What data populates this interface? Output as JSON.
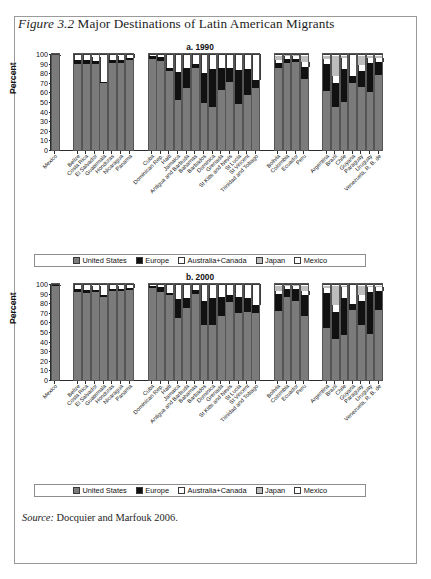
{
  "figure": {
    "label": "Figure 3.2",
    "title": "Major Destinations of Latin American Migrants",
    "source_label": "Source:",
    "source_text": "Docquier and Marfouk 2006."
  },
  "legend": {
    "items": [
      {
        "label": "United States",
        "color": "#7b7b7b",
        "key": "us"
      },
      {
        "label": "Europe",
        "color": "#111111",
        "key": "eu"
      },
      {
        "label": "Australia+Canada",
        "color": "#ffffff",
        "key": "ac"
      },
      {
        "label": "Japan",
        "color": "#bdbdbd",
        "key": "jp"
      },
      {
        "label": "Mexico",
        "color": "#ffffff",
        "key": "mx"
      }
    ]
  },
  "axis": {
    "ylabel": "Percent",
    "yticks": [
      0,
      10,
      20,
      30,
      40,
      50,
      60,
      70,
      80,
      90,
      100
    ],
    "ylim": [
      0,
      100
    ]
  },
  "chart_data": [
    {
      "type": "bar",
      "title": "a. 1990",
      "stacked": true,
      "xlabel": "",
      "ylabel": "Percent",
      "ylim": [
        0,
        100
      ],
      "grid": false,
      "legend_position": "bottom",
      "series": [
        {
          "name": "United States",
          "key": "us"
        },
        {
          "name": "Europe",
          "key": "eu"
        },
        {
          "name": "Australia+Canada",
          "key": "ac"
        },
        {
          "name": "Japan",
          "key": "jp"
        },
        {
          "name": "Mexico",
          "key": "mx"
        }
      ],
      "groups": [
        {
          "name": "Mexico",
          "categories": [
            "Mexico"
          ],
          "values": [
            [
              99.5,
              0.3,
              0.1,
              0.1,
              0.0
            ]
          ]
        },
        {
          "name": "Central America",
          "categories": [
            "Belize",
            "Costa Rica",
            "El Salvador",
            "Guatemala",
            "Honduras",
            "Nicaragua",
            "Panama"
          ],
          "values": [
            [
              91,
              4,
              5,
              0,
              0
            ],
            [
              91,
              4,
              5,
              0,
              0
            ],
            [
              91,
              3,
              4,
              0,
              2
            ],
            [
              70,
              2,
              26,
              0,
              2
            ],
            [
              92,
              3,
              5,
              0,
              0
            ],
            [
              92,
              3,
              4,
              0,
              1
            ],
            [
              95,
              2,
              3,
              0,
              0
            ]
          ]
        },
        {
          "name": "Caribbean",
          "categories": [
            "Cuba",
            "Dominican Rep.",
            "Haiti",
            "Jamaica",
            "Antigua and Barbuda",
            "Bahamas",
            "Barbados",
            "Dominica",
            "Grenada",
            "St Kitts and Nevis",
            "St Lucia",
            "St Vincent",
            "Trinidad and Tobago"
          ],
          "values": [
            [
              96,
              3,
              1,
              0,
              0
            ],
            [
              94,
              4,
              2,
              0,
              0
            ],
            [
              83,
              3,
              14,
              0,
              0
            ],
            [
              53,
              29,
              18,
              0,
              0
            ],
            [
              65,
              21,
              14,
              0,
              0
            ],
            [
              86,
              5,
              9,
              0,
              0
            ],
            [
              50,
              31,
              19,
              0,
              0
            ],
            [
              45,
              40,
              15,
              0,
              0
            ],
            [
              63,
              23,
              14,
              0,
              0
            ],
            [
              72,
              14,
              14,
              0,
              0
            ],
            [
              48,
              36,
              16,
              0,
              0
            ],
            [
              58,
              27,
              15,
              0,
              0
            ],
            [
              65,
              9,
              26,
              0,
              0
            ]
          ]
        },
        {
          "name": "Andean",
          "categories": [
            "Bolivia",
            "Colombia",
            "Ecuador",
            "Peru"
          ],
          "values": [
            [
              86,
              6,
              3,
              4,
              1
            ],
            [
              92,
              4,
              3,
              1,
              0
            ],
            [
              93,
              3,
              3,
              1,
              0
            ],
            [
              75,
              12,
              6,
              6,
              1
            ]
          ]
        },
        {
          "name": "Southern Cone and other",
          "categories": [
            "Argentina",
            "Brazil",
            "Chile",
            "Guyana",
            "Paraguay",
            "Uruguay",
            "Venezuela, R. B. de"
          ],
          "values": [
            [
              62,
              29,
              5,
              3,
              1
            ],
            [
              45,
              26,
              7,
              21,
              1
            ],
            [
              50,
              35,
              12,
              2,
              1
            ],
            [
              71,
              7,
              22,
              0,
              0
            ],
            [
              66,
              17,
              6,
              10,
              1
            ],
            [
              61,
              31,
              5,
              2,
              1
            ],
            [
              79,
              14,
              4,
              2,
              1
            ]
          ]
        }
      ]
    },
    {
      "type": "bar",
      "title": "b. 2000",
      "stacked": true,
      "xlabel": "",
      "ylabel": "Percent",
      "ylim": [
        0,
        100
      ],
      "grid": false,
      "legend_position": "bottom",
      "series": [
        {
          "name": "United States",
          "key": "us"
        },
        {
          "name": "Europe",
          "key": "eu"
        },
        {
          "name": "Australia+Canada",
          "key": "ac"
        },
        {
          "name": "Japan",
          "key": "jp"
        },
        {
          "name": "Mexico",
          "key": "mx"
        }
      ],
      "groups": [
        {
          "name": "Mexico",
          "categories": [
            "Mexico"
          ],
          "values": [
            [
              99.3,
              0.4,
              0.2,
              0.1,
              0.0
            ]
          ]
        },
        {
          "name": "Central America",
          "categories": [
            "Belize",
            "Costa Rica",
            "El Salvador",
            "Guatemala",
            "Honduras",
            "Nicaragua",
            "Panama"
          ],
          "values": [
            [
              93,
              3,
              4,
              0,
              0
            ],
            [
              92,
              3,
              5,
              0,
              0
            ],
            [
              93,
              2,
              4,
              0,
              1
            ],
            [
              87,
              2,
              10,
              0,
              1
            ],
            [
              94,
              2,
              4,
              0,
              0
            ],
            [
              94,
              2,
              3,
              0,
              1
            ],
            [
              95,
              2,
              3,
              0,
              0
            ]
          ]
        },
        {
          "name": "Caribbean",
          "categories": [
            "Cuba",
            "Dominican Rep.",
            "Haiti",
            "Jamaica",
            "Antigua and Barbuda",
            "Bahamas",
            "Barbados",
            "Dominica",
            "Grenada",
            "St Kitts and Nevis",
            "St Lucia",
            "St Vincent",
            "Trinidad and Tobago"
          ],
          "values": [
            [
              97,
              2,
              1,
              0,
              0
            ],
            [
              93,
              5,
              2,
              0,
              0
            ],
            [
              89,
              3,
              8,
              0,
              0
            ],
            [
              65,
              20,
              15,
              0,
              0
            ],
            [
              76,
              10,
              14,
              0,
              0
            ],
            [
              91,
              4,
              5,
              0,
              0
            ],
            [
              58,
              25,
              17,
              0,
              0
            ],
            [
              58,
              28,
              14,
              0,
              0
            ],
            [
              67,
              20,
              13,
              0,
              0
            ],
            [
              82,
              7,
              11,
              0,
              0
            ],
            [
              70,
              17,
              13,
              0,
              0
            ],
            [
              72,
              14,
              14,
              0,
              0
            ],
            [
              71,
              8,
              21,
              0,
              0
            ]
          ]
        },
        {
          "name": "Andean",
          "categories": [
            "Bolivia",
            "Colombia",
            "Ecuador",
            "Peru"
          ],
          "values": [
            [
              73,
              17,
              4,
              5,
              1
            ],
            [
              87,
              9,
              3,
              1,
              0
            ],
            [
              83,
              13,
              3,
              1,
              0
            ],
            [
              67,
              22,
              5,
              5,
              1
            ]
          ]
        },
        {
          "name": "Southern Cone and other",
          "categories": [
            "Argentina",
            "Brazil",
            "Chile",
            "Guyana",
            "Paraguay",
            "Uruguay",
            "Venezuela, R. B. de"
          ],
          "values": [
            [
              55,
              37,
              5,
              2,
              1
            ],
            [
              43,
              29,
              7,
              20,
              1
            ],
            [
              47,
              39,
              12,
              1,
              1
            ],
            [
              74,
              6,
              20,
              0,
              0
            ],
            [
              58,
              25,
              6,
              10,
              1
            ],
            [
              48,
              45,
              5,
              1,
              1
            ],
            [
              74,
              20,
              4,
              1,
              1
            ]
          ]
        }
      ]
    }
  ]
}
